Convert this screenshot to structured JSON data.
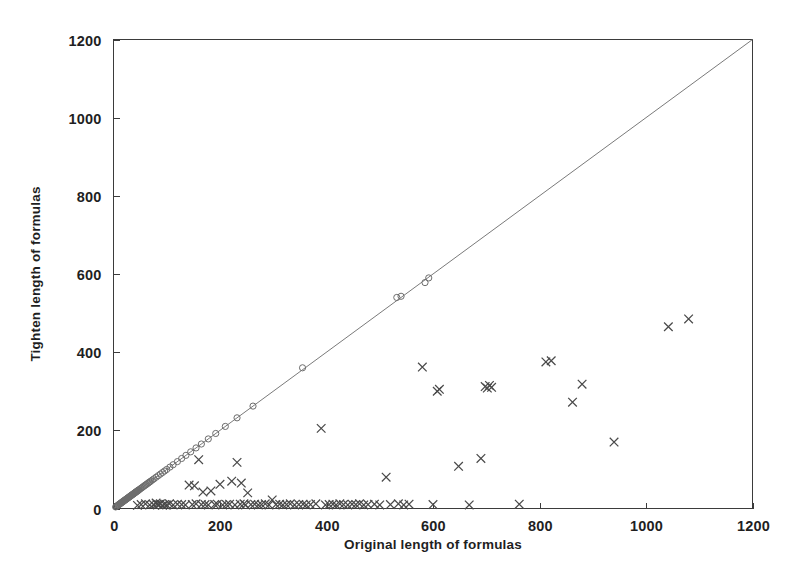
{
  "chart_data": {
    "type": "scatter",
    "title": "",
    "xlabel": "Original length of formulas",
    "ylabel": "Tighten length of formulas",
    "xlim": [
      0,
      1200
    ],
    "ylim": [
      0,
      1200
    ],
    "xticks": [
      0,
      200,
      400,
      600,
      800,
      1000,
      1200
    ],
    "yticks": [
      0,
      200,
      400,
      600,
      800,
      1000,
      1200
    ],
    "xtick_labels": [
      "0",
      "200",
      "400",
      "600",
      "800",
      "1000",
      "1200"
    ],
    "ytick_labels": [
      "0",
      "200",
      "400",
      "600",
      "800",
      "1000",
      "1200"
    ],
    "grid": false,
    "legend": "none",
    "reference_line": {
      "name": "y = x diagonal",
      "from": [
        0,
        0
      ],
      "to": [
        1200,
        1200
      ],
      "color": "#7a7a7a"
    },
    "series": [
      {
        "name": "unchanged (on diagonal)",
        "marker": "circle",
        "color": "#6d6d6d",
        "points": [
          [
            4,
            4
          ],
          [
            6,
            6
          ],
          [
            8,
            8
          ],
          [
            9,
            9
          ],
          [
            10,
            10
          ],
          [
            11,
            11
          ],
          [
            12,
            12
          ],
          [
            13,
            13
          ],
          [
            14,
            14
          ],
          [
            15,
            15
          ],
          [
            16,
            16
          ],
          [
            17,
            17
          ],
          [
            18,
            18
          ],
          [
            19,
            19
          ],
          [
            20,
            20
          ],
          [
            21,
            21
          ],
          [
            22,
            22
          ],
          [
            23,
            23
          ],
          [
            24,
            24
          ],
          [
            25,
            25
          ],
          [
            26,
            26
          ],
          [
            27,
            27
          ],
          [
            28,
            28
          ],
          [
            29,
            29
          ],
          [
            30,
            30
          ],
          [
            31,
            31
          ],
          [
            32,
            32
          ],
          [
            33,
            33
          ],
          [
            34,
            34
          ],
          [
            35,
            35
          ],
          [
            36,
            36
          ],
          [
            37,
            37
          ],
          [
            38,
            38
          ],
          [
            39,
            39
          ],
          [
            40,
            40
          ],
          [
            41,
            41
          ],
          [
            42,
            42
          ],
          [
            43,
            43
          ],
          [
            44,
            44
          ],
          [
            45,
            45
          ],
          [
            46,
            46
          ],
          [
            47,
            47
          ],
          [
            48,
            48
          ],
          [
            50,
            50
          ],
          [
            52,
            52
          ],
          [
            54,
            54
          ],
          [
            56,
            56
          ],
          [
            58,
            58
          ],
          [
            60,
            60
          ],
          [
            62,
            62
          ],
          [
            64,
            64
          ],
          [
            66,
            66
          ],
          [
            68,
            68
          ],
          [
            70,
            70
          ],
          [
            73,
            73
          ],
          [
            76,
            76
          ],
          [
            80,
            80
          ],
          [
            84,
            84
          ],
          [
            88,
            88
          ],
          [
            92,
            92
          ],
          [
            96,
            96
          ],
          [
            100,
            100
          ],
          [
            106,
            106
          ],
          [
            112,
            112
          ],
          [
            120,
            120
          ],
          [
            128,
            128
          ],
          [
            136,
            136
          ],
          [
            145,
            145
          ],
          [
            155,
            155
          ],
          [
            165,
            165
          ],
          [
            178,
            178
          ],
          [
            192,
            192
          ],
          [
            210,
            210
          ],
          [
            232,
            232
          ],
          [
            262,
            262
          ],
          [
            355,
            360
          ],
          [
            532,
            540
          ],
          [
            540,
            543
          ],
          [
            585,
            578
          ],
          [
            592,
            590
          ]
        ]
      },
      {
        "name": "tightened (below diagonal)",
        "marker": "x",
        "color": "#4a4a4a",
        "points": [
          [
            45,
            8
          ],
          [
            52,
            10
          ],
          [
            60,
            12
          ],
          [
            68,
            9
          ],
          [
            75,
            10
          ],
          [
            80,
            14
          ],
          [
            82,
            11
          ],
          [
            85,
            10
          ],
          [
            88,
            12
          ],
          [
            92,
            8
          ],
          [
            96,
            10
          ],
          [
            100,
            9
          ],
          [
            105,
            12
          ],
          [
            112,
            9
          ],
          [
            120,
            11
          ],
          [
            128,
            10
          ],
          [
            135,
            9
          ],
          [
            142,
            60
          ],
          [
            148,
            10
          ],
          [
            152,
            58
          ],
          [
            155,
            12
          ],
          [
            160,
            125
          ],
          [
            165,
            10
          ],
          [
            168,
            42
          ],
          [
            172,
            10
          ],
          [
            178,
            9
          ],
          [
            183,
            45
          ],
          [
            190,
            10
          ],
          [
            195,
            11
          ],
          [
            200,
            62
          ],
          [
            205,
            9
          ],
          [
            212,
            10
          ],
          [
            218,
            11
          ],
          [
            222,
            70
          ],
          [
            228,
            9
          ],
          [
            232,
            118
          ],
          [
            238,
            11
          ],
          [
            240,
            65
          ],
          [
            245,
            12
          ],
          [
            248,
            9
          ],
          [
            252,
            40
          ],
          [
            258,
            10
          ],
          [
            265,
            11
          ],
          [
            272,
            9
          ],
          [
            278,
            10
          ],
          [
            285,
            12
          ],
          [
            292,
            9
          ],
          [
            298,
            22
          ],
          [
            305,
            10
          ],
          [
            312,
            11
          ],
          [
            318,
            9
          ],
          [
            325,
            10
          ],
          [
            332,
            12
          ],
          [
            340,
            9
          ],
          [
            348,
            10
          ],
          [
            356,
            11
          ],
          [
            362,
            9
          ],
          [
            370,
            10
          ],
          [
            380,
            12
          ],
          [
            390,
            205
          ],
          [
            398,
            9
          ],
          [
            405,
            10
          ],
          [
            412,
            11
          ],
          [
            418,
            9
          ],
          [
            425,
            12
          ],
          [
            432,
            10
          ],
          [
            440,
            9
          ],
          [
            448,
            11
          ],
          [
            455,
            10
          ],
          [
            462,
            12
          ],
          [
            470,
            9
          ],
          [
            478,
            10
          ],
          [
            490,
            11
          ],
          [
            500,
            9
          ],
          [
            512,
            80
          ],
          [
            520,
            10
          ],
          [
            535,
            12
          ],
          [
            545,
            9
          ],
          [
            555,
            11
          ],
          [
            580,
            362
          ],
          [
            600,
            10
          ],
          [
            608,
            300
          ],
          [
            612,
            305
          ],
          [
            648,
            108
          ],
          [
            668,
            9
          ],
          [
            690,
            128
          ],
          [
            698,
            312
          ],
          [
            702,
            308
          ],
          [
            706,
            315
          ],
          [
            710,
            310
          ],
          [
            762,
            11
          ],
          [
            812,
            375
          ],
          [
            822,
            378
          ],
          [
            862,
            272
          ],
          [
            880,
            318
          ],
          [
            940,
            170
          ],
          [
            1042,
            465
          ],
          [
            1080,
            485
          ]
        ]
      }
    ]
  },
  "axes": {
    "x_axis_title": "Original length of formulas",
    "y_axis_title": "Tighten length of formulas"
  }
}
